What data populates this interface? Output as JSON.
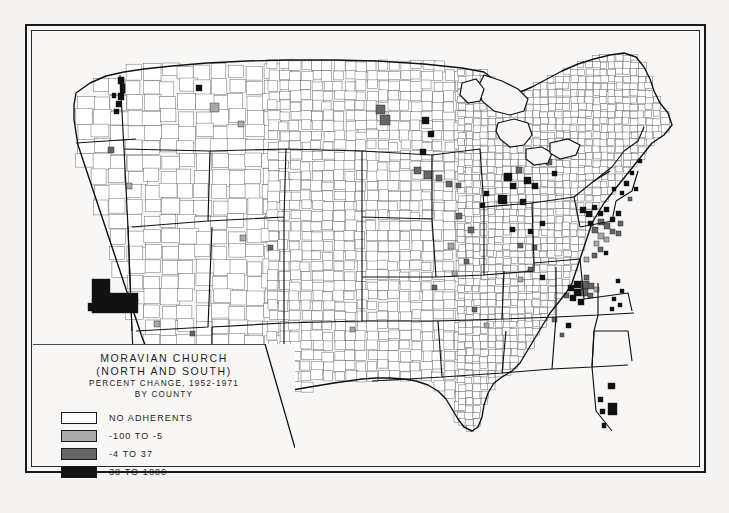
{
  "map": {
    "title_line1": "MORAVIAN CHURCH",
    "title_line2": "(NORTH AND SOUTH)",
    "subtitle_line1": "PERCENT CHANGE, 1952-1971",
    "subtitle_line2": "BY COUNTY",
    "projection_note": "",
    "legend": {
      "items": [
        {
          "label": "NO ADHERENTS",
          "color": "#ffffff"
        },
        {
          "label": "-100 TO -5",
          "color": "#a9a9a9"
        },
        {
          "label": "-4 TO 37",
          "color": "#656565"
        },
        {
          "label": "38 TO 1000",
          "color": "#111111"
        }
      ]
    },
    "colors": {
      "paper": "#f4f3f1",
      "frame": "#1a1a1a",
      "county_line": "#555555",
      "state_line": "#111111",
      "water": "#f8f7f5"
    }
  },
  "chart_data": {
    "type": "choropleth",
    "title": "MORAVIAN CHURCH (NORTH AND SOUTH) PERCENT CHANGE, 1952-1971 BY COUNTY",
    "unit": "percent change",
    "geography": "United States counties",
    "period": {
      "start_year": 1952,
      "end_year": 1971
    },
    "classes": [
      {
        "label": "NO ADHERENTS",
        "min": null,
        "max": null,
        "color": "#ffffff"
      },
      {
        "label": "-100 TO -5",
        "min": -100,
        "max": -5,
        "color": "#a9a9a9"
      },
      {
        "label": "-4 TO 37",
        "min": -4,
        "max": 37,
        "color": "#656565"
      },
      {
        "label": "38 TO 1000",
        "min": 38,
        "max": 1000,
        "color": "#111111"
      }
    ],
    "legend_position": "lower-left inset"
  }
}
